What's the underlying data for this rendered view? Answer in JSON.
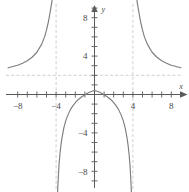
{
  "figure": {
    "kind": "cartesian-graph",
    "width": 189,
    "height": 192,
    "background": "#ffffff"
  },
  "colors": {
    "curve": "#7d7d7d",
    "axis": "#5a5a5a",
    "asymptote": "#c3c3c9",
    "label": "#4a4a4a"
  },
  "axes": {
    "x_name": "x",
    "y_name": "y",
    "x_labels": [
      "−8",
      "−4",
      "4",
      "8"
    ],
    "y_labels": [
      "8",
      "4",
      "−4",
      "−8"
    ],
    "x_label_values": [
      -8,
      -4,
      4,
      8
    ],
    "y_label_values": [
      8,
      4,
      -4,
      -8
    ]
  },
  "chart_data": {
    "type": "line",
    "title": "",
    "subtitle": "",
    "xlabel": "x",
    "ylabel": "y",
    "xlim": [
      -9,
      9
    ],
    "ylim": [
      -9.5,
      9.5
    ],
    "xticks": [
      -8,
      -7,
      -6,
      -5,
      -4,
      -3,
      -2,
      -1,
      1,
      2,
      3,
      4,
      5,
      6,
      7,
      8
    ],
    "yticks": [
      -9,
      -8,
      -7,
      -6,
      -5,
      -4,
      -3,
      -2,
      -1,
      1,
      2,
      3,
      4,
      5,
      6,
      7,
      8,
      9
    ],
    "xtick_labels": [
      "−8",
      "−4",
      "4",
      "8"
    ],
    "ytick_labels": [
      "8",
      "4",
      "−4",
      "−8"
    ],
    "grid": false,
    "legend": false,
    "legend_position": "none",
    "annotations": [
      {
        "text": "vertical asymptote",
        "x": -4
      },
      {
        "text": "vertical asymptote",
        "x": 4
      },
      {
        "text": "horizontal asymptote",
        "y": 2
      }
    ],
    "asymptotes": {
      "vertical": [
        -4,
        4
      ],
      "horizontal": [
        2
      ]
    },
    "series": [
      {
        "name": "left branch",
        "comment": "x from -9 to -4, decreasing toward horizontal asymptote y=2 on the left, rising to +infinity as x approaches -4 from the left",
        "x": [
          -9.0,
          -8.5,
          -8.0,
          -7.5,
          -7.0,
          -6.5,
          -6.0,
          -5.5,
          -5.2,
          -5.0,
          -4.8,
          -4.6,
          -4.45,
          -4.35,
          -4.25,
          -4.2,
          -4.15,
          -4.12
        ],
        "y": [
          2.78,
          2.92,
          3.05,
          3.25,
          3.52,
          3.88,
          4.4,
          5.25,
          6.0,
          6.7,
          7.6,
          8.7,
          9.6,
          10.4,
          11.6,
          12.5,
          13.6,
          14.5
        ]
      },
      {
        "name": "middle branch",
        "comment": "x from -4 to 4, arches just above the origin peaking near y=0.4, plunging to -infinity near both vertical asymptotes",
        "x": [
          -3.88,
          -3.8,
          -3.7,
          -3.6,
          -3.5,
          -3.4,
          -3.2,
          -3.0,
          -2.8,
          -2.5,
          -2.2,
          -1.8,
          -1.4,
          -1.0,
          -0.6,
          -0.2,
          0.0,
          0.2,
          0.6,
          1.0,
          1.4,
          1.8,
          2.2,
          2.5,
          2.8,
          3.0,
          3.2,
          3.4,
          3.5,
          3.6,
          3.7,
          3.8,
          3.88
        ],
        "y": [
          -11.0,
          -9.2,
          -7.4,
          -6.2,
          -5.3,
          -4.6,
          -3.5,
          -2.75,
          -2.2,
          -1.55,
          -1.1,
          -0.62,
          -0.28,
          -0.02,
          0.2,
          0.36,
          0.4,
          0.36,
          0.2,
          -0.02,
          -0.28,
          -0.62,
          -1.1,
          -1.55,
          -2.2,
          -2.75,
          -3.5,
          -4.6,
          -5.3,
          -6.2,
          -7.4,
          -9.2,
          -11.0
        ]
      },
      {
        "name": "right branch",
        "comment": "x from 4 to 9, falling from +infinity near x=4 toward the horizontal asymptote y=2",
        "x": [
          4.12,
          4.15,
          4.2,
          4.25,
          4.35,
          4.45,
          4.6,
          4.8,
          5.0,
          5.2,
          5.5,
          6.0,
          6.5,
          7.0,
          7.5,
          8.0,
          8.5,
          9.0
        ],
        "y": [
          14.5,
          13.6,
          12.5,
          11.6,
          10.4,
          9.6,
          8.7,
          7.6,
          6.7,
          6.0,
          5.25,
          4.4,
          3.88,
          3.52,
          3.25,
          3.05,
          2.92,
          2.78
        ]
      }
    ]
  }
}
